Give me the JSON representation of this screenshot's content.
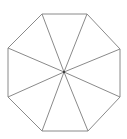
{
  "diagram": {
    "shape": "regular octagon divided into 8 triangles by lines from each vertex to the center",
    "stroke_color": "#8a8a8a",
    "background": "#ffffff",
    "center": [
      64,
      72
    ],
    "vertices": [
      [
        42,
        14
      ],
      [
        87,
        14
      ],
      [
        120,
        49
      ],
      [
        120,
        97
      ],
      [
        88,
        131
      ],
      [
        42,
        131
      ],
      [
        8,
        97
      ],
      [
        8,
        48
      ]
    ]
  }
}
